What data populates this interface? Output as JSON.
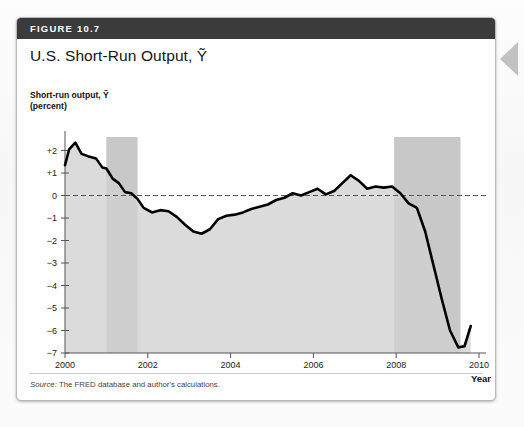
{
  "figure": {
    "number_label": "FIGURE 10.7",
    "title": "U.S. Short-Run Output, Ỹ",
    "source": "Source: The FRED database and author's calculations.",
    "source_prefix": "Source:",
    "source_rest": " The FRED database and author's calculations."
  },
  "colors": {
    "header_bar": "#3b3b3b",
    "line": "#000000",
    "area_fill": "#d9d9d9",
    "recession_band": "#c8c8c8",
    "zero_line": "#555555",
    "axis": "#555555",
    "page": "#ffffff"
  },
  "chart_data": {
    "type": "line",
    "title": "U.S. Short-Run Output, Ỹ",
    "subtitle": "",
    "xlabel": "Year",
    "ylabel": "Short-run output, Ỹ (percent)",
    "ylabel_line1": "Short-run output, Ỹ",
    "ylabel_line2": "(percent)",
    "xlim": [
      2000,
      2010
    ],
    "ylim": [
      -7,
      2.6
    ],
    "grid": false,
    "legend": null,
    "y_ticks": [
      "+2",
      "+1",
      "0",
      "−1",
      "−2",
      "−3",
      "−4",
      "−5",
      "−6",
      "−7"
    ],
    "y_tick_values": [
      2,
      1,
      0,
      -1,
      -2,
      -3,
      -4,
      -5,
      -6,
      -7
    ],
    "x_ticks": [
      "2000",
      "2002",
      "2004",
      "2006",
      "2008",
      "2010"
    ],
    "x_tick_values": [
      2000,
      2002,
      2004,
      2006,
      2008,
      2010
    ],
    "zero_reference_line": 0,
    "shaded_regions": [
      {
        "label": "recession-2001",
        "x_start": 2001.0,
        "x_end": 2001.75
      },
      {
        "label": "recession-2008",
        "x_start": 2007.95,
        "x_end": 2009.55
      }
    ],
    "series": [
      {
        "name": "Short-run output",
        "x": [
          2000.0,
          2000.1,
          2000.25,
          2000.4,
          2000.55,
          2000.75,
          2000.9,
          2001.0,
          2001.15,
          2001.3,
          2001.45,
          2001.6,
          2001.75,
          2001.9,
          2002.1,
          2002.3,
          2002.5,
          2002.7,
          2002.9,
          2003.1,
          2003.3,
          2003.5,
          2003.7,
          2003.9,
          2004.1,
          2004.3,
          2004.5,
          2004.7,
          2004.9,
          2005.1,
          2005.3,
          2005.5,
          2005.7,
          2005.9,
          2006.1,
          2006.3,
          2006.5,
          2006.7,
          2006.9,
          2007.1,
          2007.3,
          2007.5,
          2007.7,
          2007.9,
          2008.1,
          2008.3,
          2008.5,
          2008.7,
          2008.9,
          2009.1,
          2009.3,
          2009.5,
          2009.65,
          2009.8
        ],
        "y": [
          1.35,
          2.05,
          2.35,
          1.85,
          1.75,
          1.65,
          1.25,
          1.2,
          0.75,
          0.55,
          0.15,
          0.1,
          -0.15,
          -0.55,
          -0.75,
          -0.65,
          -0.7,
          -0.95,
          -1.3,
          -1.6,
          -1.7,
          -1.5,
          -1.05,
          -0.9,
          -0.85,
          -0.75,
          -0.6,
          -0.5,
          -0.4,
          -0.2,
          -0.1,
          0.1,
          0.0,
          0.15,
          0.3,
          0.05,
          0.2,
          0.55,
          0.9,
          0.65,
          0.3,
          0.4,
          0.35,
          0.4,
          0.1,
          -0.35,
          -0.55,
          -1.6,
          -3.1,
          -4.6,
          -6.0,
          -6.75,
          -6.7,
          -5.8
        ]
      }
    ]
  }
}
